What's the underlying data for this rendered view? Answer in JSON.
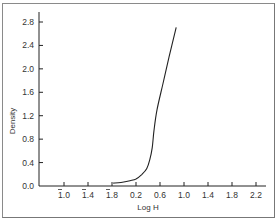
{
  "chart_data": {
    "type": "line",
    "title": "",
    "xlabel": "Log H",
    "ylabel": "Density",
    "x_tick_labels": [
      {
        "bar": true,
        "label": "1.0",
        "value": -1.0
      },
      {
        "bar": true,
        "label": "1.4",
        "value": -0.6
      },
      {
        "bar": true,
        "label": "1.8",
        "value": -0.2
      },
      {
        "bar": false,
        "label": "0.2",
        "value": 0.2
      },
      {
        "bar": false,
        "label": "0.6",
        "value": 0.6
      },
      {
        "bar": false,
        "label": "1.0",
        "value": 1.0
      },
      {
        "bar": false,
        "label": "1.4",
        "value": 1.4
      },
      {
        "bar": false,
        "label": "1.8",
        "value": 1.8
      },
      {
        "bar": false,
        "label": "2.2",
        "value": 2.2
      }
    ],
    "y_tick_labels": [
      "0.0",
      "0.4",
      "0.8",
      "1.2",
      "1.6",
      "2.0",
      "2.4",
      "2.8"
    ],
    "xlim": [
      -1.4,
      2.4
    ],
    "ylim": [
      0.0,
      2.8
    ],
    "grid": false,
    "legend": null,
    "series": [
      {
        "name": "Density",
        "x": [
          -0.18,
          -0.05,
          0.1,
          0.2,
          0.3,
          0.38,
          0.43,
          0.47,
          0.5,
          0.55,
          0.65,
          0.75,
          0.87
        ],
        "y": [
          0.05,
          0.06,
          0.09,
          0.12,
          0.2,
          0.3,
          0.45,
          0.65,
          0.95,
          1.3,
          1.75,
          2.2,
          2.71
        ]
      }
    ]
  }
}
